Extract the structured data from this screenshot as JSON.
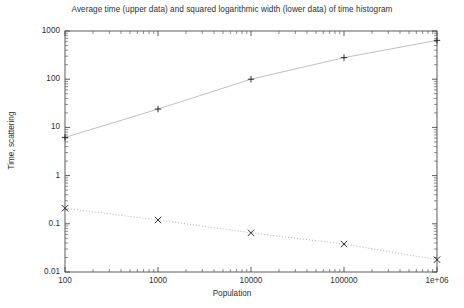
{
  "chart_data": {
    "type": "line",
    "title": "Average time (upper data) and squared logarithmic width (lower data) of time histogram",
    "xlabel": "Population",
    "ylabel": "Time, scattering",
    "xscale": "log",
    "yscale": "log",
    "xlim": [
      100,
      1000000
    ],
    "ylim": [
      0.01,
      1000
    ],
    "grid": false,
    "legend": "none",
    "xticks": [
      {
        "value": 100,
        "label": "100"
      },
      {
        "value": 1000,
        "label": "1000"
      },
      {
        "value": 10000,
        "label": "10000"
      },
      {
        "value": 100000,
        "label": "100000"
      },
      {
        "value": 1000000,
        "label": "1e+06"
      }
    ],
    "yticks": [
      {
        "value": 1000,
        "label": "1000"
      },
      {
        "value": 100,
        "label": "100"
      },
      {
        "value": 10,
        "label": "10"
      },
      {
        "value": 1,
        "label": "1"
      },
      {
        "value": 0.1,
        "label": "0.1"
      },
      {
        "value": 0.01,
        "label": "0.01"
      }
    ],
    "x": [
      100,
      1000,
      10000,
      100000,
      1000000
    ],
    "series": [
      {
        "name": "Average time (upper data)",
        "marker": "plus",
        "linestyle": "solid",
        "color": "#b8b8b8",
        "values": [
          6.2,
          24,
          100,
          280,
          640
        ]
      },
      {
        "name": "Squared logarithmic width (lower data)",
        "marker": "cross",
        "linestyle": "dotted",
        "color": "#a8a8a8",
        "values": [
          0.21,
          0.12,
          0.065,
          0.038,
          0.018
        ]
      }
    ]
  }
}
